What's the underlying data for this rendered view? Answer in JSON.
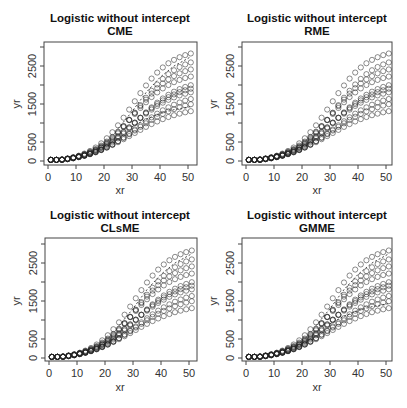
{
  "figure": {
    "layout": "2x2 grid",
    "panels": [
      {
        "id": "cme",
        "title_line1": "Logistic without intercept",
        "title_line2": "CME",
        "xlabel": "xr",
        "ylabel": "yr"
      },
      {
        "id": "rme",
        "title_line1": "Logistic without intercept",
        "title_line2": "RME",
        "xlabel": "xr",
        "ylabel": "yr"
      },
      {
        "id": "clsme",
        "title_line1": "Logistic without intercept",
        "title_line2": "CLsME",
        "xlabel": "xr",
        "ylabel": "yr"
      },
      {
        "id": "gmme",
        "title_line1": "Logistic without intercept",
        "title_line2": "GMME",
        "xlabel": "xr",
        "ylabel": "yr"
      }
    ]
  },
  "chart_data": [
    {
      "type": "scatter",
      "title": "Logistic without intercept CME",
      "xlabel": "xr",
      "ylabel": "yr",
      "xlim": [
        0,
        52
      ],
      "ylim": [
        0,
        3000
      ],
      "xticks": [
        0,
        10,
        20,
        30,
        40,
        50
      ],
      "yticks": [
        0,
        500,
        1000,
        1500,
        2000,
        2500,
        3000
      ],
      "ytick_labels": [
        "0",
        "500",
        "",
        "1500",
        "",
        "2500",
        ""
      ],
      "grid": false,
      "x": [
        1,
        3,
        5,
        7,
        9,
        11,
        13,
        15,
        17,
        19,
        21,
        23,
        25,
        27,
        29,
        31,
        33,
        35,
        37,
        39,
        41,
        43,
        45,
        47,
        49,
        51
      ],
      "series_asymptotes": [
        1500,
        1700,
        1850,
        2000,
        2100,
        2200,
        2400,
        2600,
        2800,
        3000
      ],
      "marker": "open-circle",
      "fitted_curves": [
        {
          "name": "upper",
          "style": "dashed",
          "x": [
            25,
            30,
            35,
            40,
            45,
            50,
            51
          ],
          "y": [
            850,
            1300,
            1800,
            2200,
            2500,
            2700,
            2750
          ]
        },
        {
          "name": "lower",
          "style": "dashed",
          "x": [
            30,
            35,
            40,
            45,
            50,
            51
          ],
          "y": [
            900,
            1100,
            1250,
            1350,
            1420,
            1430
          ]
        }
      ]
    },
    {
      "type": "scatter",
      "title": "Logistic without intercept RME",
      "xlabel": "xr",
      "ylabel": "yr",
      "xlim": [
        0,
        52
      ],
      "ylim": [
        0,
        3000
      ],
      "xticks": [
        0,
        10,
        20,
        30,
        40,
        50
      ],
      "yticks": [
        0,
        500,
        1000,
        1500,
        2000,
        2500,
        3000
      ],
      "grid": false,
      "x": [
        1,
        3,
        5,
        7,
        9,
        11,
        13,
        15,
        17,
        19,
        21,
        23,
        25,
        27,
        29,
        31,
        33,
        35,
        37,
        39,
        41,
        43,
        45,
        47,
        49,
        51
      ],
      "series_asymptotes": [
        1500,
        1700,
        1850,
        2000,
        2100,
        2200,
        2400,
        2600,
        2800,
        3000
      ],
      "marker": "open-circle",
      "fitted_curves": []
    },
    {
      "type": "scatter",
      "title": "Logistic without intercept CLsME",
      "xlabel": "xr",
      "ylabel": "yr",
      "xlim": [
        0,
        52
      ],
      "ylim": [
        0,
        3000
      ],
      "xticks": [
        0,
        10,
        20,
        30,
        40,
        50
      ],
      "yticks": [
        0,
        500,
        1000,
        1500,
        2000,
        2500,
        3000
      ],
      "grid": false,
      "x": [
        1,
        3,
        5,
        7,
        9,
        11,
        13,
        15,
        17,
        19,
        21,
        23,
        25,
        27,
        29,
        31,
        33,
        35,
        37,
        39,
        41,
        43,
        45,
        47,
        49,
        51
      ],
      "series_asymptotes": [
        1500,
        1700,
        1850,
        2000,
        2100,
        2200,
        2400,
        2600,
        2800,
        3000
      ],
      "marker": "open-circle",
      "fitted_curves": [
        {
          "name": "upper",
          "style": "dashed",
          "x": [
            25,
            30,
            35,
            40,
            45,
            50,
            51
          ],
          "y": [
            850,
            1300,
            1800,
            2200,
            2500,
            2700,
            2750
          ]
        }
      ]
    },
    {
      "type": "scatter",
      "title": "Logistic without intercept GMME",
      "xlabel": "xr",
      "ylabel": "yr",
      "xlim": [
        0,
        52
      ],
      "ylim": [
        0,
        3000
      ],
      "xticks": [
        0,
        10,
        20,
        30,
        40,
        50
      ],
      "yticks": [
        0,
        500,
        1000,
        1500,
        2000,
        2500,
        3000
      ],
      "grid": false,
      "x": [
        1,
        3,
        5,
        7,
        9,
        11,
        13,
        15,
        17,
        19,
        21,
        23,
        25,
        27,
        29,
        31,
        33,
        35,
        37,
        39,
        41,
        43,
        45,
        47,
        49,
        51
      ],
      "series_asymptotes": [
        1500,
        1700,
        1850,
        2000,
        2100,
        2200,
        2400,
        2600,
        2800,
        3000
      ],
      "marker": "open-circle",
      "fitted_curves": [
        {
          "name": "upper",
          "style": "dashed",
          "x": [
            25,
            30,
            35,
            40,
            45,
            50,
            51
          ],
          "y": [
            850,
            1300,
            1800,
            2200,
            2500,
            2700,
            2750
          ]
        },
        {
          "name": "lower",
          "style": "dashed",
          "x": [
            30,
            35,
            40,
            45,
            50,
            51
          ],
          "y": [
            900,
            1100,
            1250,
            1350,
            1420,
            1430
          ]
        }
      ]
    }
  ]
}
